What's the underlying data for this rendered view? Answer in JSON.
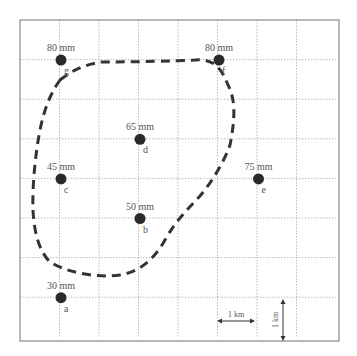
{
  "figure": {
    "grid": {
      "cols": 8,
      "rows": 8,
      "cell_size_label": "1 km"
    },
    "stations": [
      {
        "id": "a",
        "label": "30 mm",
        "col": 1,
        "row": 7
      },
      {
        "id": "b",
        "label": "50 mm",
        "col": 3,
        "row": 5
      },
      {
        "id": "c",
        "label": "45 mm",
        "col": 1,
        "row": 4
      },
      {
        "id": "d",
        "label": "65 mm",
        "col": 3,
        "row": 3
      },
      {
        "id": "e",
        "label": "75 mm",
        "col": 6,
        "row": 4
      },
      {
        "id": "f",
        "label": "80 mm",
        "col": 5,
        "row": 1
      },
      {
        "id": "g",
        "label": "80 mm",
        "col": 1,
        "row": 1
      }
    ],
    "scale": {
      "horizontal_label": "1 km",
      "vertical_label": "1 km"
    },
    "catchment_boundary": "dashed"
  }
}
